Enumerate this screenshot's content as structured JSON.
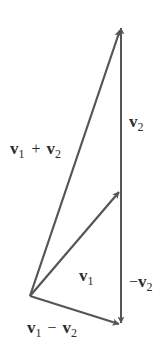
{
  "diagram": {
    "type": "vector-addition-subtraction",
    "colors": {
      "line": "#555555",
      "text": "#2b2b2b",
      "background": "#ffffff"
    },
    "vectors": [
      {
        "id": "v1",
        "name": "v1",
        "from": "O",
        "to": "A"
      },
      {
        "id": "v2",
        "name": "v2",
        "from": "A",
        "to": "S"
      },
      {
        "id": "neg_v2",
        "name": "-v2",
        "from": "A",
        "to": "D"
      },
      {
        "id": "sum",
        "name": "v1 + v2",
        "from": "O",
        "to": "S"
      },
      {
        "id": "diff",
        "name": "v1 - v2",
        "from": "O",
        "to": "D"
      }
    ],
    "labels": {
      "sum": {
        "v_a": "v",
        "sub_a": "1",
        "op": "+",
        "v_b": "v",
        "sub_b": "2"
      },
      "v2": {
        "v": "v",
        "sub": "2"
      },
      "v1": {
        "v": "v",
        "sub": "1"
      },
      "neg_v2": {
        "op": "−",
        "v": "v",
        "sub": "2"
      },
      "diff": {
        "v_a": "v",
        "sub_a": "1",
        "op": "−",
        "v_b": "v",
        "sub_b": "2"
      }
    }
  }
}
